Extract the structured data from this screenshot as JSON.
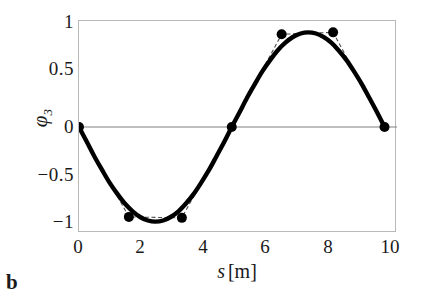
{
  "panel": {
    "label": "b"
  },
  "chart_data": {
    "type": "line",
    "title": "",
    "subtitle": "",
    "xlabel": "s [m]",
    "xlabel_symbol": "s",
    "xlabel_unit": "[m]",
    "ylabel": "φ₃",
    "ylabel_symbol": "φ",
    "ylabel_subscript": "3",
    "xlim": [
      0,
      10.2
    ],
    "ylim": [
      -1.12,
      1.12
    ],
    "xticks": [
      0,
      2,
      4,
      6,
      8,
      10
    ],
    "xticklabels": [
      "0",
      "2",
      "4",
      "6",
      "8",
      "10"
    ],
    "yticks": [
      1,
      0.5,
      0,
      -0.5,
      -1
    ],
    "yticklabels": [
      "1",
      "0.5",
      "0",
      "−0.5",
      "−1"
    ],
    "grid": false,
    "legend": null,
    "zero_line": 0,
    "colors": {
      "curve": "#000000",
      "marker": "#000000",
      "dashed": "#555555",
      "zero_line": "#808080",
      "frame": "#b9b9b9",
      "background": "#ffffff"
    },
    "series": [
      {
        "name": "mode shape (smooth)",
        "style": "solid-thick",
        "x": [
          0.0,
          0.25,
          0.49,
          0.74,
          0.98,
          1.23,
          1.47,
          1.72,
          1.96,
          2.21,
          2.45,
          2.7,
          2.94,
          3.19,
          3.43,
          3.68,
          3.92,
          4.17,
          4.41,
          4.66,
          4.9,
          5.15,
          5.39,
          5.64,
          5.88,
          6.13,
          6.37,
          6.62,
          6.86,
          7.11,
          7.35,
          7.6,
          7.84,
          8.09,
          8.33,
          8.58,
          8.82,
          9.07,
          9.31,
          9.56,
          9.8
        ],
        "y": [
          0.0,
          -0.156,
          -0.309,
          -0.454,
          -0.588,
          -0.707,
          -0.809,
          -0.891,
          -0.951,
          -0.988,
          -1.0,
          -0.988,
          -0.951,
          -0.891,
          -0.809,
          -0.707,
          -0.588,
          -0.454,
          -0.309,
          -0.156,
          0.0,
          0.156,
          0.309,
          0.454,
          0.588,
          0.707,
          0.809,
          0.891,
          0.951,
          0.988,
          1.0,
          0.988,
          0.951,
          0.891,
          0.809,
          0.707,
          0.588,
          0.454,
          0.309,
          0.156,
          0.0
        ]
      },
      {
        "name": "nodal points (piecewise-linear)",
        "style": "dashed-thin-with-markers",
        "x": [
          0.0,
          1.6,
          3.3,
          4.9,
          6.5,
          8.15,
          9.8
        ],
        "y": [
          0.0,
          -0.95,
          -0.96,
          0.0,
          0.98,
          1.0,
          0.0
        ]
      }
    ],
    "markers": [
      {
        "x": 0.0,
        "y": 0.0
      },
      {
        "x": 1.6,
        "y": -0.95
      },
      {
        "x": 3.3,
        "y": -0.96
      },
      {
        "x": 4.9,
        "y": 0.0
      },
      {
        "x": 6.5,
        "y": 0.98
      },
      {
        "x": 8.15,
        "y": 1.0
      },
      {
        "x": 9.8,
        "y": 0.0
      }
    ],
    "marker_count": 7,
    "marker_radius_px": 5
  }
}
